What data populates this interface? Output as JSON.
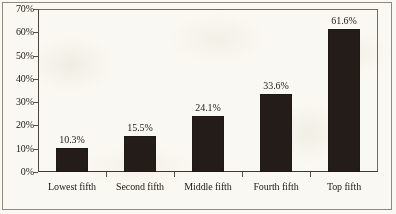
{
  "chart_data": {
    "type": "bar",
    "title": "",
    "subtitle": "",
    "xlabel": "",
    "ylabel": "",
    "categories": [
      "Lowest fifth",
      "Second fifth",
      "Middle fifth",
      "Fourth fifth",
      "Top fifth"
    ],
    "values": [
      10.3,
      15.5,
      24.1,
      33.6,
      61.6
    ],
    "value_labels": [
      "10.3%",
      "15.5%",
      "24.1%",
      "33.6%",
      "61.6%"
    ],
    "ylim": [
      0,
      70
    ],
    "ytick_values": [
      0,
      10,
      20,
      30,
      40,
      50,
      60,
      70
    ],
    "ytick_labels": [
      "0%",
      "10%",
      "20%",
      "30%",
      "40%",
      "50%",
      "60%",
      "70%"
    ],
    "grid": false,
    "legend": null,
    "bar_color": "#241c18",
    "background_color": "#faf8f2",
    "axis_color": "#3b3832",
    "text_color": "#1f1b16"
  }
}
